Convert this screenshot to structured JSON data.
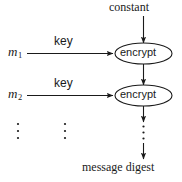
{
  "diagram": {
    "colors": {
      "stroke": "#1a1a1a",
      "text": "#1a1a1a",
      "background": "#ffffff"
    },
    "labels": {
      "constant": "constant",
      "encrypt_1": "encrypt",
      "encrypt_2": "encrypt",
      "key_1": "key",
      "key_2": "key",
      "message_1": "m",
      "message_1_sub": "1",
      "message_2": "m",
      "message_2_sub": "2",
      "message_digest": "message digest"
    },
    "icons": {
      "vertical_ellipsis_messages": "vertical-ellipsis-icon",
      "vertical_ellipsis_keys": "vertical-ellipsis-icon",
      "vertical_ellipsis_chain": "vertical-ellipsis-icon",
      "arrow_down_constant": "arrow-down-icon",
      "arrow_right_m1": "arrow-right-icon",
      "arrow_right_m2": "arrow-right-icon",
      "arrow_down_chain_1": "arrow-down-icon",
      "arrow_down_chain_2": "arrow-down-icon",
      "arrow_down_digest": "arrow-down-icon"
    }
  }
}
